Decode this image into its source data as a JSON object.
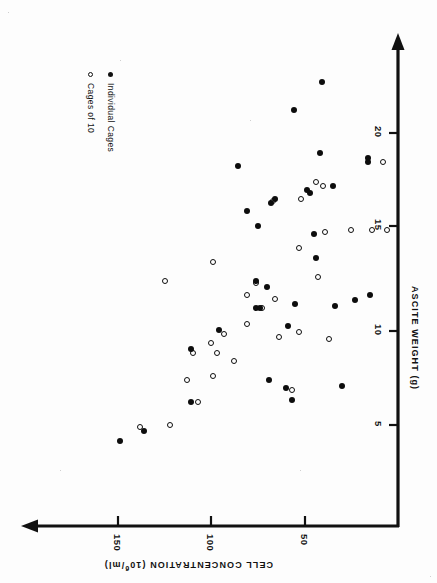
{
  "chart_data": {
    "type": "scatter",
    "title": "",
    "orientation": "rotated-90-ccw",
    "xlabel": "ASCITE WEIGHT (g)",
    "ylabel": "CELL CONCENTRATION (10⁶/ml)",
    "ylabel_parts": {
      "pre": "CELL CONCENTRATION (10",
      "sup": "6",
      "post": "/ml)"
    },
    "xticks": [
      5,
      10,
      15,
      20
    ],
    "xtick_labels": [
      "5",
      "10",
      "15",
      "20"
    ],
    "yticks": [
      50,
      100,
      150
    ],
    "ytick_labels": [
      "50",
      "100",
      "150"
    ],
    "xlim": [
      0,
      23.5
    ],
    "ylim": [
      0,
      165
    ],
    "grid": false,
    "legend_position": "upper-left",
    "marker_colors": {
      "open": "#ffffff",
      "filled": "#0d0d0d",
      "edge": "#0d0d0d"
    },
    "series": [
      {
        "name": "Cages of 10",
        "marker": "open-circle",
        "points": [
          [
            4.9,
            138
          ],
          [
            5.0,
            122
          ],
          [
            6.2,
            107
          ],
          [
            7.3,
            113
          ],
          [
            7.5,
            99
          ],
          [
            8.3,
            88
          ],
          [
            8.7,
            110
          ],
          [
            8.7,
            97
          ],
          [
            9.2,
            100
          ],
          [
            9.4,
            37
          ],
          [
            9.5,
            64
          ],
          [
            9.7,
            93
          ],
          [
            10.2,
            81
          ],
          [
            11.0,
            73
          ],
          [
            11.5,
            66
          ],
          [
            11.7,
            81
          ],
          [
            12.3,
            76
          ],
          [
            12.4,
            125
          ],
          [
            12.6,
            43
          ],
          [
            13.4,
            99
          ],
          [
            14.1,
            53
          ],
          [
            14.9,
            39
          ],
          [
            15.0,
            25
          ],
          [
            15.0,
            14
          ],
          [
            15.0,
            6
          ],
          [
            16.5,
            67
          ],
          [
            16.6,
            52
          ],
          [
            17.3,
            40
          ],
          [
            17.5,
            44
          ],
          [
            18.5,
            8
          ],
          [
            6.8,
            57
          ],
          [
            9.8,
            53
          ]
        ]
      },
      {
        "name": "Individual Cages",
        "marker": "filled-circle",
        "points": [
          [
            4.2,
            149
          ],
          [
            4.7,
            136
          ],
          [
            6.2,
            111
          ],
          [
            6.3,
            57
          ],
          [
            6.9,
            60
          ],
          [
            7.3,
            69
          ],
          [
            8.9,
            111
          ],
          [
            9.9,
            96
          ],
          [
            10.1,
            59
          ],
          [
            11.0,
            76
          ],
          [
            11.0,
            74
          ],
          [
            11.1,
            34
          ],
          [
            11.2,
            55
          ],
          [
            11.4,
            23
          ],
          [
            11.7,
            15
          ],
          [
            12.1,
            70
          ],
          [
            12.4,
            76
          ],
          [
            13.6,
            44
          ],
          [
            14.8,
            45
          ],
          [
            15.2,
            75
          ],
          [
            16.0,
            81
          ],
          [
            16.4,
            68
          ],
          [
            16.6,
            66
          ],
          [
            16.9,
            47
          ],
          [
            17.1,
            49
          ],
          [
            17.3,
            35
          ],
          [
            18.3,
            86
          ],
          [
            18.5,
            16
          ],
          [
            18.7,
            16
          ],
          [
            19.0,
            42
          ],
          [
            21.2,
            56
          ],
          [
            22.6,
            41
          ],
          [
            7.0,
            30
          ]
        ]
      }
    ]
  },
  "legend": {
    "items": [
      {
        "label": "Cages of 10",
        "marker": "open-circle"
      },
      {
        "label": "Individual Cages",
        "marker": "filled-circle"
      }
    ]
  },
  "axes": {
    "x_axis_name": "ascite-weight-axis",
    "y_axis_name": "cell-concentration-axis",
    "x_title": "ASCITE WEIGHT (g)",
    "y_title_pre": "CELL CONCENTRATION (10",
    "y_title_sup": "6",
    "y_title_post": "/ml)"
  }
}
